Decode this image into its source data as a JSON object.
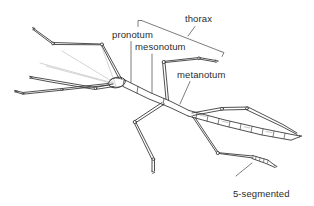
{
  "figure": {
    "kind": "scientific-line-drawing",
    "background_color": "#ffffff",
    "line_color": "#3c3c3c",
    "faint_line_color": "#b9b9b9",
    "leader_color": "#555555",
    "text_color": "#2b2b2b"
  },
  "labels": {
    "thorax": "thorax",
    "pronotum": "pronotum",
    "mesonotum": "mesonotum",
    "metanotum": "metanotum",
    "tarsus_line1": "5-segmented",
    "tarsus_line2": "tarsus"
  }
}
